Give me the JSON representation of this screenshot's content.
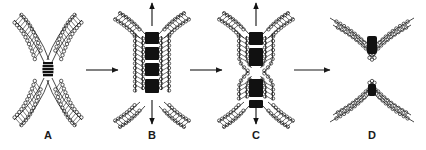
{
  "figure": {
    "type": "diagram",
    "background_color": "#ffffff",
    "ink_color": "#1a1a1a",
    "dense_color": "#111111",
    "width": 426,
    "height": 150
  },
  "panels": [
    {
      "id": "A",
      "label": "A",
      "label_x": 48,
      "label_y": 139,
      "center_x": 48,
      "description": "two apposed membranes pinched into an hourglass contact point",
      "has_vertical_arrows": false,
      "dark_bands": 1
    },
    {
      "id": "B",
      "label": "B",
      "label_x": 152,
      "label_y": 139,
      "center_x": 152,
      "description": "elongated fusion tube with four stacked dark bands, arrows pulling up and down",
      "has_vertical_arrows": true,
      "dark_bands": 4
    },
    {
      "id": "C",
      "label": "C",
      "label_x": 256,
      "label_y": 139,
      "center_x": 256,
      "description": "tube constricted at the waist, splitting into upper and lower halves, arrows pulling apart",
      "has_vertical_arrows": true,
      "dark_bands": 2
    },
    {
      "id": "D",
      "label": "D",
      "label_x": 372,
      "label_y": 139,
      "center_x": 372,
      "description": "two fully separated membranes, upper V-shaped cup and lower inverted-V dome",
      "has_vertical_arrows": false,
      "dark_bands": 2
    }
  ],
  "transition_arrows": [
    {
      "id": "arrow-a-b",
      "from": "A",
      "to": "B",
      "x1": 86,
      "x2": 118,
      "y": 70
    },
    {
      "id": "arrow-b-c",
      "from": "B",
      "to": "C",
      "x1": 190,
      "x2": 222,
      "y": 70
    },
    {
      "id": "arrow-c-d",
      "from": "C",
      "to": "D",
      "x1": 294,
      "x2": 330,
      "y": 70
    }
  ],
  "vertical_arrows": [
    {
      "id": "arrow-b-up",
      "panel": "B",
      "direction": "up",
      "x": 152,
      "y1": 26,
      "y2": 3
    },
    {
      "id": "arrow-b-down",
      "panel": "B",
      "direction": "down",
      "x": 152,
      "y1": 100,
      "y2": 124
    },
    {
      "id": "arrow-c-up",
      "panel": "C",
      "direction": "up",
      "x": 256,
      "y1": 26,
      "y2": 3
    },
    {
      "id": "arrow-c-down",
      "panel": "C",
      "direction": "down",
      "x": 256,
      "y1": 100,
      "y2": 124
    }
  ]
}
